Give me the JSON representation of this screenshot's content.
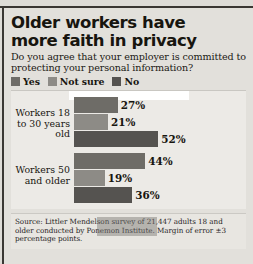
{
  "headline": {
    "line1": "Older workers have",
    "line2": "more faith in privacy"
  },
  "subhead": {
    "line1": "Do you agree that your employer is committed to",
    "line2": "protecting your personal information?"
  },
  "legend": [
    {
      "label": "Yes",
      "color": "#6e6c67"
    },
    {
      "label": "Not sure",
      "color": "#8d8b86"
    },
    {
      "label": "No",
      "color": "#555350"
    }
  ],
  "source": {
    "line1": "Source: Littler Mendelson survey of 21,447 adults 18 and",
    "line2": "older conducted by Ponemon Institute. Margin of error ±3",
    "line3": "percentage points."
  },
  "chart_data": {
    "type": "bar",
    "orientation": "horizontal",
    "title": "Older workers have more faith in privacy",
    "subtitle": "Do you agree that your employer is committed to protecting your personal information?",
    "xlabel": "",
    "ylabel": "",
    "xlim": [
      0,
      100
    ],
    "unit": "%",
    "grid": false,
    "legend_position": "top-left",
    "categories": [
      "Workers 18 to 30 years old",
      "Workers 50 and older"
    ],
    "series": [
      {
        "name": "Yes",
        "color": "#6e6c67",
        "values": [
          27,
          44
        ]
      },
      {
        "name": "Not sure",
        "color": "#8d8b86",
        "values": [
          21,
          19
        ]
      },
      {
        "name": "No",
        "color": "#555350",
        "values": [
          52,
          36
        ]
      }
    ],
    "groups": [
      {
        "label_lines": [
          "Workers 18",
          "to 30 years",
          "old"
        ],
        "bars": [
          {
            "series": "Yes",
            "value": 27,
            "value_label": "27%",
            "color": "#6e6c67"
          },
          {
            "series": "Not sure",
            "value": 21,
            "value_label": "21%",
            "color": "#8d8b86"
          },
          {
            "series": "No",
            "value": 52,
            "value_label": "52%",
            "color": "#555350"
          }
        ]
      },
      {
        "label_lines": [
          "Workers 50",
          "and older"
        ],
        "bars": [
          {
            "series": "Yes",
            "value": 44,
            "value_label": "44%",
            "color": "#6e6c67"
          },
          {
            "series": "Not sure",
            "value": 19,
            "value_label": "19%",
            "color": "#8d8b86"
          },
          {
            "series": "No",
            "value": 36,
            "value_label": "36%",
            "color": "#555350"
          }
        ]
      }
    ],
    "source_note": "Source: Littler Mendelson survey of 21,447 adults 18 and older conducted by Ponemon Institute. Margin of error ±3 percentage points."
  }
}
